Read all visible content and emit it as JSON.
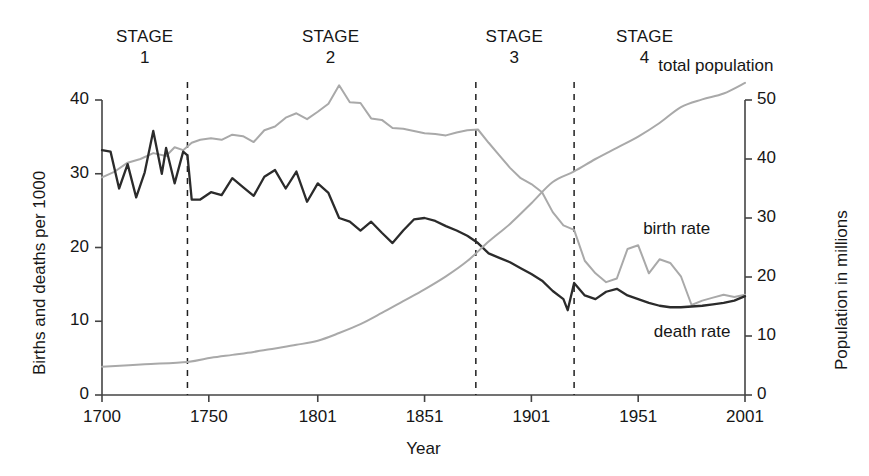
{
  "chart_data": {
    "type": "line",
    "title": "",
    "xlabel": "Year",
    "ylabel": "Births and deaths per 1000",
    "y2label": "Population in millions",
    "xlim": [
      1700,
      2001
    ],
    "ylim": [
      0,
      40
    ],
    "y2lim": [
      0,
      50
    ],
    "grid": false,
    "legend_position": "inline-annotations",
    "xticks": [
      1700,
      1750,
      1801,
      1851,
      1901,
      1951,
      2001
    ],
    "xtick_labels": [
      "1700",
      "1750",
      "1801",
      "1851",
      "1901",
      "1951",
      "2001"
    ],
    "yticks": [
      0,
      10,
      20,
      30,
      40
    ],
    "ytick_labels": [
      "0",
      "10",
      "20",
      "30",
      "40"
    ],
    "y2ticks": [
      0,
      10,
      20,
      30,
      40,
      50
    ],
    "y2tick_labels": [
      "0",
      "10",
      "20",
      "30",
      "40",
      "50"
    ],
    "stage_boundaries": [
      1740,
      1875,
      1921
    ],
    "stages": [
      {
        "word": "STAGE",
        "number": "1",
        "center_year": 1720
      },
      {
        "word": "STAGE",
        "number": "2",
        "center_year": 1807
      },
      {
        "word": "STAGE",
        "number": "3",
        "center_year": 1893
      },
      {
        "word": "STAGE",
        "number": "4",
        "center_year": 1954
      }
    ],
    "series": [
      {
        "name": "birth rate",
        "axis": "left",
        "color": "#a9a9a9",
        "label_year": 1958,
        "label_value": 22.5,
        "x": [
          1700,
          1706,
          1712,
          1718,
          1724,
          1730,
          1734,
          1738,
          1742,
          1746,
          1751,
          1756,
          1761,
          1766,
          1771,
          1776,
          1781,
          1786,
          1791,
          1796,
          1801,
          1806,
          1811,
          1816,
          1821,
          1826,
          1831,
          1836,
          1841,
          1846,
          1851,
          1856,
          1861,
          1866,
          1871,
          1876,
          1881,
          1886,
          1891,
          1896,
          1901,
          1906,
          1911,
          1916,
          1921,
          1926,
          1931,
          1936,
          1941,
          1946,
          1951,
          1956,
          1961,
          1966,
          1971,
          1976,
          1981,
          1986,
          1991,
          1996,
          2001
        ],
        "y": [
          29.5,
          30.3,
          31.5,
          32.0,
          32.8,
          32.4,
          33.6,
          33.2,
          34.2,
          34.6,
          34.8,
          34.6,
          35.3,
          35.1,
          34.3,
          35.9,
          36.4,
          37.6,
          38.2,
          37.4,
          38.4,
          39.5,
          42.0,
          39.7,
          39.6,
          37.5,
          37.3,
          36.2,
          36.1,
          35.8,
          35.5,
          35.4,
          35.2,
          35.6,
          35.9,
          36.0,
          34.2,
          32.5,
          30.8,
          29.4,
          28.6,
          27.5,
          24.8,
          23.0,
          22.4,
          18.2,
          16.5,
          15.3,
          15.8,
          19.8,
          20.3,
          16.5,
          18.4,
          17.9,
          16.1,
          12.2,
          12.8,
          13.2,
          13.6,
          13.3,
          13.6
        ]
      },
      {
        "name": "death rate",
        "axis": "left",
        "color": "#2b2b2b",
        "label_year": 1963,
        "label_value": 8.5,
        "x": [
          1700,
          1704,
          1708,
          1712,
          1716,
          1720,
          1724,
          1728,
          1730,
          1734,
          1738,
          1740,
          1742,
          1746,
          1751,
          1756,
          1761,
          1766,
          1771,
          1776,
          1781,
          1786,
          1791,
          1796,
          1801,
          1806,
          1811,
          1816,
          1821,
          1826,
          1831,
          1836,
          1841,
          1846,
          1851,
          1856,
          1861,
          1866,
          1871,
          1876,
          1881,
          1886,
          1891,
          1896,
          1901,
          1906,
          1911,
          1916,
          1918,
          1921,
          1926,
          1931,
          1936,
          1941,
          1946,
          1951,
          1956,
          1961,
          1966,
          1971,
          1976,
          1981,
          1986,
          1991,
          1996,
          2001
        ],
        "y": [
          33.2,
          33.0,
          28.0,
          31.3,
          26.8,
          30.2,
          35.8,
          30.0,
          33.5,
          28.7,
          33.0,
          32.5,
          26.5,
          26.5,
          27.5,
          27.1,
          29.4,
          28.2,
          27.0,
          29.6,
          30.5,
          28.0,
          30.3,
          26.2,
          28.7,
          27.4,
          24.0,
          23.5,
          22.3,
          23.5,
          22.0,
          20.6,
          22.3,
          23.8,
          24.0,
          23.6,
          22.9,
          22.3,
          21.6,
          20.6,
          19.2,
          18.6,
          18.0,
          17.2,
          16.4,
          15.5,
          14.1,
          13.0,
          11.5,
          15.2,
          13.5,
          13.0,
          14.0,
          14.4,
          13.5,
          13.0,
          12.5,
          12.1,
          11.9,
          11.9,
          12.0,
          12.1,
          12.3,
          12.5,
          12.8,
          13.4
        ]
      },
      {
        "name": "total population",
        "axis": "right",
        "color": "#a9a9a9",
        "label_year": 1966,
        "label_value": 55.0,
        "x": [
          1700,
          1720,
          1740,
          1751,
          1761,
          1771,
          1781,
          1791,
          1801,
          1811,
          1821,
          1831,
          1841,
          1851,
          1861,
          1871,
          1881,
          1891,
          1901,
          1911,
          1921,
          1931,
          1941,
          1951,
          1961,
          1971,
          1981,
          1991,
          2001
        ],
        "y": [
          4.8,
          5.2,
          5.6,
          6.3,
          6.8,
          7.3,
          7.9,
          8.5,
          9.2,
          10.5,
          12.0,
          13.9,
          15.9,
          17.9,
          20.1,
          22.7,
          26.0,
          29.0,
          32.5,
          36.1,
          37.9,
          40.0,
          41.9,
          43.8,
          46.1,
          48.8,
          50.1,
          51.1,
          52.9
        ]
      }
    ]
  }
}
